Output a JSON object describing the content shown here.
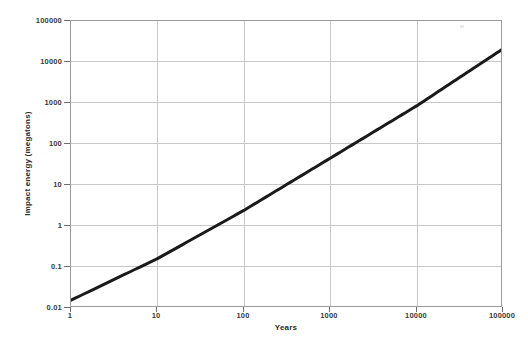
{
  "chart_data": {
    "type": "line",
    "title": "",
    "subtitle": "",
    "xlabel": "Years",
    "ylabel": "Impact energy (megatons)",
    "xscale": "log",
    "yscale": "log",
    "xlim": [
      1,
      100000
    ],
    "ylim": [
      0.01,
      100000
    ],
    "grid": true,
    "legend": false,
    "legend_position": "none",
    "x_ticks": [
      "1",
      "10",
      "100",
      "1000",
      "10000",
      "100000"
    ],
    "x_tick_values": [
      1,
      10,
      100,
      1000,
      10000,
      100000
    ],
    "y_ticks": [
      "0.01",
      "0.1",
      "1",
      "10",
      "100",
      "1000",
      "10000",
      "100000"
    ],
    "y_tick_values": [
      0.01,
      0.1,
      1,
      10,
      100,
      1000,
      10000,
      100000
    ],
    "series": [
      {
        "name": "Impact energy vs. recurrence interval",
        "color": "#1a1a1a",
        "line_width": 3,
        "x": [
          1,
          10,
          100,
          1000,
          10000,
          100000
        ],
        "y": [
          0.0155,
          0.16,
          2.4,
          45,
          850,
          21000
        ]
      }
    ],
    "annotations": []
  },
  "axes": {
    "y_title": "Impact energy (megatons)",
    "x_title": "Years",
    "y_tick_labels": [
      "100000",
      "10000",
      "1000",
      "100",
      "10",
      "1",
      "0.1",
      "0.01"
    ],
    "x_tick_labels": [
      "1",
      "10",
      "100",
      "1000",
      "10000",
      "100000"
    ]
  }
}
